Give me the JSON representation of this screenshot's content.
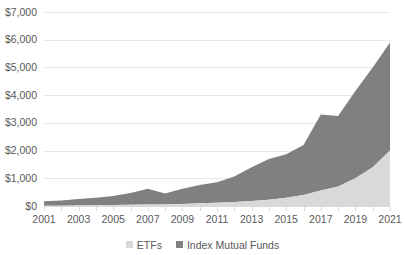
{
  "chart_data": {
    "type": "area",
    "stacked": true,
    "title": "",
    "subtitle": "",
    "xlabel": "",
    "ylabel": "",
    "grid": true,
    "legend_position": "bottom",
    "ylim": [
      0,
      7000
    ],
    "ytick_values": [
      0,
      1000,
      2000,
      3000,
      4000,
      5000,
      6000,
      7000
    ],
    "ytick_labels": [
      "$0",
      "$1,000",
      "$2,000",
      "$3,000",
      "$4,000",
      "$5,000",
      "$6,000",
      "$7,000"
    ],
    "x": [
      2001,
      2002,
      2003,
      2004,
      2005,
      2006,
      2007,
      2008,
      2009,
      2010,
      2011,
      2012,
      2013,
      2014,
      2015,
      2016,
      2017,
      2018,
      2019,
      2020,
      2021
    ],
    "xtick_labels": [
      "2001",
      "",
      "2003",
      "",
      "2005",
      "",
      "2007",
      "",
      "2009",
      "",
      "2011",
      "",
      "2013",
      "",
      "2015",
      "",
      "2017",
      "",
      "2019",
      "",
      "2021"
    ],
    "xtick_labels_shown": [
      "2001",
      "2003",
      "2005",
      "2007",
      "2009",
      "2011",
      "2013",
      "2015",
      "2017",
      "2019",
      "2021"
    ],
    "series": [
      {
        "name": "ETFs",
        "color": "#d9d9d9",
        "values": [
          65,
          80,
          120,
          180,
          250,
          380,
          560,
          470,
          660,
          860,
          980,
          1200,
          1600,
          1900,
          2050,
          2450,
          3300,
          3350,
          4200,
          5400,
          6000
        ]
      },
      {
        "name": "Index Mutual Funds",
        "color": "#808080",
        "values": [
          175,
          195,
          250,
          300,
          360,
          470,
          620,
          450,
          620,
          760,
          860,
          1060,
          1400,
          1700,
          1870,
          2200,
          3300,
          3250,
          4150,
          5000,
          5900
        ]
      }
    ],
    "series_etfs_only": [
      5,
      8,
      15,
      25,
      35,
      45,
      55,
      50,
      75,
      100,
      115,
      140,
      180,
      230,
      300,
      400,
      560,
      700,
      1000,
      1400,
      2000
    ],
    "series_index_mutual_funds_only": [
      170,
      187,
      235,
      275,
      325,
      425,
      565,
      400,
      545,
      660,
      745,
      920,
      1220,
      1470,
      1570,
      1800,
      2740,
      2550,
      3150,
      3600,
      3900
    ],
    "totals": [
      175,
      195,
      250,
      300,
      360,
      470,
      620,
      450,
      620,
      760,
      860,
      1060,
      1400,
      1700,
      1870,
      2200,
      3300,
      3250,
      4150,
      5000,
      5900
    ],
    "note": "Values in billions of US dollars; stacked: ETFs bottom band, Index Mutual Funds upper band"
  },
  "legend": {
    "entries": [
      {
        "label": "ETFs",
        "color": "#d9d9d9"
      },
      {
        "label": "Index Mutual Funds",
        "color": "#808080"
      }
    ]
  },
  "colors": {
    "etfs": "#d9d9d9",
    "index_mutual_funds": "#808080",
    "gridline": "#e8e8e8",
    "text": "#595959",
    "background": "#ffffff"
  }
}
